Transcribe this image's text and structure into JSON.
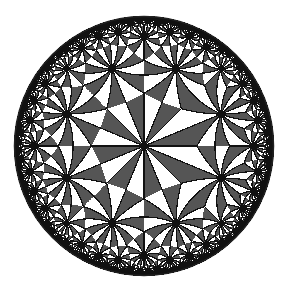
{
  "figure": {
    "type": "hyperbolic-tiling",
    "model": "poincare-disk",
    "triangle_group": [
      2,
      3,
      8
    ],
    "center_vertex_order": 8,
    "disk": {
      "cx": 144,
      "cy": 146,
      "r": 130
    },
    "colors": {
      "background": "#ffffff",
      "dark_tile": "#555555",
      "light_tile": "#ffffff",
      "edge": "#111111",
      "rim": "#222222"
    }
  }
}
